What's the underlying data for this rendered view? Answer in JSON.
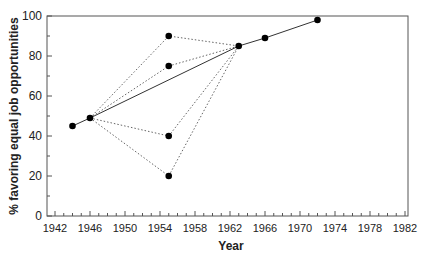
{
  "chart_data": {
    "type": "line",
    "title": "",
    "xlabel": "Year",
    "ylabel": "% favoring equal job opportunities",
    "xlim": [
      1942,
      1982
    ],
    "ylim": [
      0,
      100
    ],
    "x_ticks": [
      "1942",
      "1946",
      "1950",
      "1954",
      "1958",
      "1962",
      "1966",
      "1970",
      "1974",
      "1978",
      "1982"
    ],
    "y_ticks": [
      "0",
      "20",
      "40",
      "60",
      "80",
      "100"
    ],
    "grid": false,
    "legend": null,
    "series": [
      {
        "name": "trend",
        "style": "solid",
        "x": [
          1944,
          1946,
          1963,
          1966,
          1972
        ],
        "y": [
          45,
          49,
          85,
          89,
          98
        ]
      },
      {
        "name": "1955 variant A",
        "style": "dotted",
        "x": [
          1946,
          1955,
          1963
        ],
        "y": [
          49,
          90,
          85
        ]
      },
      {
        "name": "1955 variant B",
        "style": "dotted",
        "x": [
          1946,
          1955,
          1963
        ],
        "y": [
          49,
          75,
          85
        ]
      },
      {
        "name": "1955 variant C",
        "style": "dotted",
        "x": [
          1946,
          1955,
          1963
        ],
        "y": [
          49,
          40,
          85
        ]
      },
      {
        "name": "1955 variant D",
        "style": "dotted",
        "x": [
          1946,
          1955,
          1963
        ],
        "y": [
          49,
          20,
          85
        ]
      }
    ]
  }
}
